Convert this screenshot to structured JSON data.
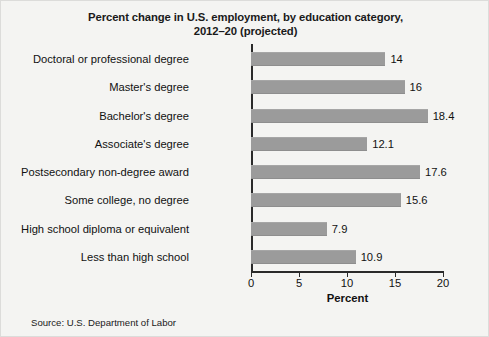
{
  "chart_data": {
    "type": "bar",
    "orientation": "horizontal",
    "title": "Percent change in U.S. employment, by education category, 2012–20 (projected)",
    "title_line1": "Percent change in U.S. employment, by education category,",
    "title_line2": "2012–20 (projected)",
    "xlabel": "Percent",
    "ylabel": "",
    "xlim": [
      0,
      20
    ],
    "xticks": [
      0,
      5,
      10,
      15,
      20
    ],
    "xtick_labels": [
      "0",
      "5",
      "10",
      "15",
      "20"
    ],
    "grid": false,
    "legend": false,
    "bar_color": "#9b9b9b",
    "categories": [
      "Doctoral or professional degree",
      "Master's degree",
      "Bachelor's degree",
      "Associate's degree",
      "Postsecondary non-degree award",
      "Some college, no degree",
      "High school diploma or equivalent",
      "Less than high school"
    ],
    "values": [
      14,
      16,
      18.4,
      12.1,
      17.6,
      15.6,
      7.9,
      10.9
    ],
    "value_labels": [
      "14",
      "16",
      "18.4",
      "12.1",
      "17.6",
      "15.6",
      "7.9",
      "10.9"
    ]
  },
  "source": {
    "text": "Source: U.S. Department of Labor"
  }
}
